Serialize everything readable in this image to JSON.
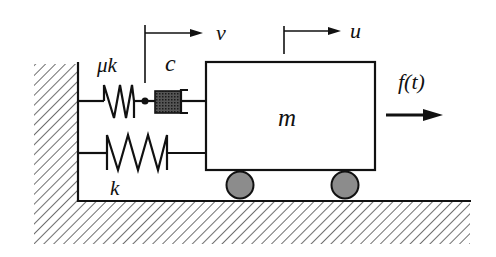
{
  "diagram": {
    "labels": {
      "maxwell_spring": "μk",
      "damper": "c",
      "parallel_spring": "k",
      "mass": "m",
      "force": "f(t)",
      "internal_displacement": "v",
      "mass_displacement": "u"
    },
    "colors": {
      "line": "#111111",
      "wheel_fill": "#8c8c8c",
      "damper_fill": "#3a3a3a",
      "background": "#ffffff"
    }
  }
}
